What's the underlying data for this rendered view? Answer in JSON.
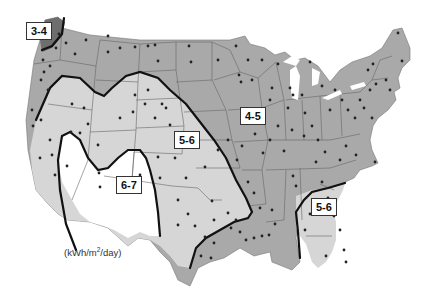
{
  "map": {
    "title": "US average solar radiation zones",
    "units_prefix": "(kWh/m",
    "units_sup": "2",
    "units_suffix": "/day)",
    "zones": [
      {
        "label": "3-4",
        "fill": "#6e6e6e"
      },
      {
        "label": "4-5",
        "fill": "#a9a9a9"
      },
      {
        "label": "5-6",
        "fill": "#d6d6d6"
      },
      {
        "label": "6-7",
        "fill": "#ffffff"
      }
    ],
    "labels": {
      "z34": "3-4",
      "z45": "4-5",
      "z56_west": "5-6",
      "z56_southeast": "5-6",
      "z67": "6-7"
    },
    "colors": {
      "zone_boundary": "#111111",
      "state_border": "#555555",
      "station_dot": "#222222"
    }
  }
}
